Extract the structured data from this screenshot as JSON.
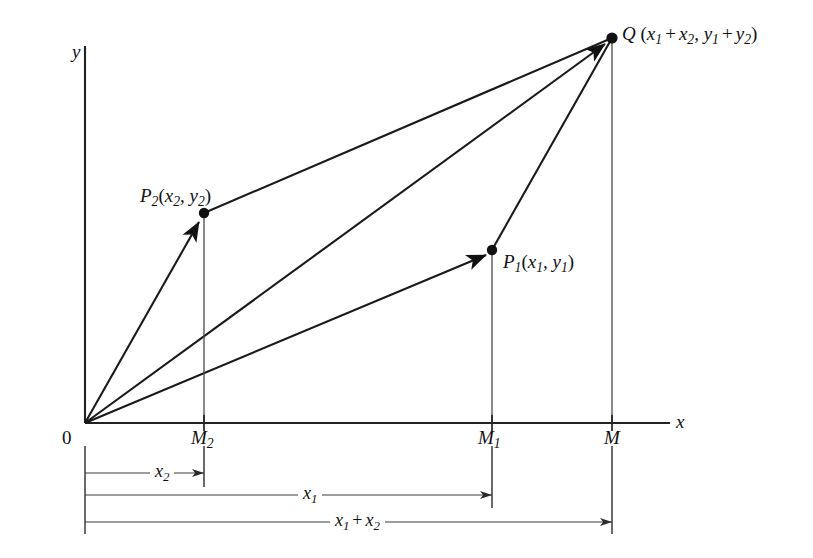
{
  "figure": {
    "background_color": "#ffffff",
    "line_color": "#1a1a1a",
    "axes": {
      "x_label": "x",
      "y_label": "y",
      "origin_label": "0"
    },
    "points": [
      {
        "name": "origin",
        "label": "0",
        "x": 85,
        "y": 423
      },
      {
        "name": "P2",
        "label_base": "P",
        "label_sub": "2",
        "args": "(x₂, y₂)",
        "x": 204,
        "y": 213
      },
      {
        "name": "P1",
        "label_base": "P",
        "label_sub": "1",
        "args": "(x₁, y₁)",
        "x": 492,
        "y": 250
      },
      {
        "name": "Q",
        "label_base": "Q",
        "args": "(x₁ + x₂, y₁ + y₂)",
        "x": 612,
        "y": 38
      }
    ],
    "point_labels": {
      "q": {
        "base": "Q",
        "sub": "",
        "open": " (",
        "v1": "x",
        "v1sub": "1",
        "plus": "+",
        "v2": "x",
        "v2sub": "2",
        "comma": ", ",
        "v3": "y",
        "v3sub": "1",
        "plus2": "+",
        "v4": "y",
        "v4sub": "2",
        "close": ")"
      },
      "p2": {
        "base": "P",
        "sub": "2",
        "open": "(",
        "v1": "x",
        "v1sub": "2",
        "comma": ", ",
        "v2": "y",
        "v2sub": "2",
        "close": ")"
      },
      "p1": {
        "base": "P",
        "sub": "1",
        "open": "(",
        "v1": "x",
        "v1sub": "1",
        "comma": ", ",
        "v2": "y",
        "v2sub": "1",
        "close": ")"
      }
    },
    "foot_labels": [
      {
        "name": "M2",
        "base": "M",
        "sub": "2",
        "x": 204
      },
      {
        "name": "M1",
        "base": "M",
        "sub": "1",
        "x": 492
      },
      {
        "name": "M",
        "base": "M",
        "sub": "",
        "x": 612
      }
    ],
    "dimensions": [
      {
        "name": "x2",
        "base": "x",
        "sub": "2",
        "from_x": 85,
        "to_x": 204,
        "y": 473
      },
      {
        "name": "x1",
        "base": "x",
        "sub": "1",
        "from_x": 85,
        "to_x": 492,
        "y": 495
      },
      {
        "name": "sum",
        "base": "x",
        "sub": "1",
        "op": "+",
        "base2": "x",
        "sub2": "2",
        "from_x": 85,
        "to_x": 612,
        "y": 522
      }
    ]
  }
}
